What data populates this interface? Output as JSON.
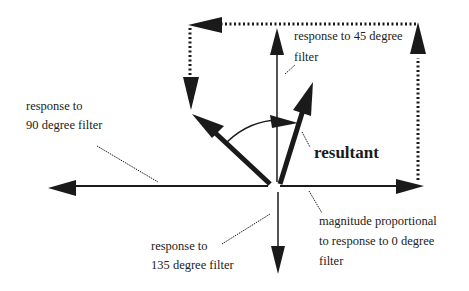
{
  "diagram": {
    "type": "vector-diagram",
    "labels": {
      "resp45_line1": "response to 45 degree",
      "resp45_line2": "filter",
      "resp90_line1": "response to",
      "resp90_line2": "90 degree filter",
      "resultant": "resultant",
      "resp135_line1": "response to",
      "resp135_line2": "135 degree filter",
      "resp0_line1": "magnitude  proportional",
      "resp0_line2": "to response to 0 degree",
      "resp0_line3": "filter"
    },
    "colors": {
      "ink": "#1a1a1a",
      "background": "#ffffff"
    },
    "vectors": [
      {
        "name": "0-degree",
        "direction_deg": 0
      },
      {
        "name": "45-degree",
        "direction_deg": 90
      },
      {
        "name": "90-degree",
        "direction_deg": 135
      },
      {
        "name": "135-degree",
        "direction_deg": 270
      },
      {
        "name": "resultant",
        "direction_deg": 70
      }
    ]
  }
}
